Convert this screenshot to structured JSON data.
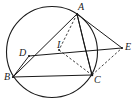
{
  "figure": {
    "background_color": "#ffffff",
    "stroke_color": "#1a1a1a",
    "label_color": "#1a1a1a",
    "width": 136,
    "height": 101
  },
  "circle": {
    "name": "circumcircle",
    "cx": 52,
    "cy": 52,
    "r": 45.5,
    "stroke_width": 1.1
  },
  "points": [
    {
      "id": "A",
      "label": "A",
      "x": 77,
      "y": 14,
      "label_x": 78,
      "label_y": 2
    },
    {
      "id": "B",
      "label": "B",
      "x": 13,
      "y": 77,
      "label_x": 4,
      "label_y": 72
    },
    {
      "id": "C",
      "label": "C",
      "x": 92,
      "y": 75,
      "label_x": 94,
      "label_y": 75
    },
    {
      "id": "D",
      "label": "D",
      "x": 29,
      "y": 56,
      "label_x": 19,
      "label_y": 48
    },
    {
      "id": "E",
      "label": "E",
      "x": 122,
      "y": 48,
      "label_x": 125,
      "label_y": 42
    },
    {
      "id": "I",
      "label": "I",
      "x": 59,
      "y": 50,
      "label_x": 57,
      "label_y": 40
    }
  ],
  "segments": [
    {
      "name": "segment-A-B",
      "from": "A",
      "to": "B",
      "style": "solid",
      "x1": 77,
      "y1": 14,
      "x2": 13,
      "y2": 77
    },
    {
      "name": "segment-A-C",
      "from": "A",
      "to": "C",
      "style": "solid",
      "x1": 77,
      "y1": 14,
      "x2": 92,
      "y2": 75
    },
    {
      "name": "segment-A-E",
      "from": "A",
      "to": "E",
      "style": "solid",
      "x1": 77,
      "y1": 14,
      "x2": 122,
      "y2": 48
    },
    {
      "name": "segment-A-I",
      "from": "A",
      "to": "I",
      "style": "dashed",
      "x1": 77,
      "y1": 14,
      "x2": 59,
      "y2": 50
    },
    {
      "name": "segment-I-C",
      "from": "I",
      "to": "C",
      "style": "dashed",
      "x1": 59,
      "y1": 50,
      "x2": 92,
      "y2": 75
    },
    {
      "name": "segment-C-E",
      "from": "C",
      "to": "E",
      "style": "dashed",
      "x1": 92,
      "y1": 75,
      "x2": 122,
      "y2": 48
    },
    {
      "name": "segment-D-E",
      "from": "D",
      "to": "E",
      "style": "solid",
      "x1": 29,
      "y1": 56,
      "x2": 122,
      "y2": 48
    },
    {
      "name": "segment-D-B",
      "from": "D",
      "to": "B",
      "style": "solid",
      "x1": 29,
      "y1": 56,
      "x2": 13,
      "y2": 77
    },
    {
      "name": "segment-B-C",
      "from": "B",
      "to": "C",
      "style": "solid",
      "x1": 13,
      "y1": 77,
      "x2": 92,
      "y2": 75
    }
  ],
  "arcs": [
    {
      "name": "arc-A-C",
      "from": "A",
      "to": "C",
      "style": "solid",
      "path": "M 77 14 Q 84 45 92 75"
    }
  ]
}
